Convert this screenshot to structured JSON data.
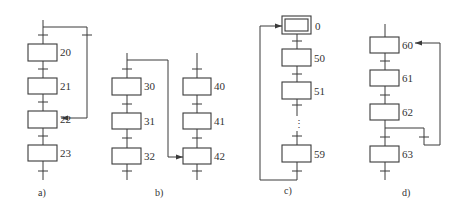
{
  "diagram": {
    "type": "SFC / GRAFCET sequence examples",
    "colors": {
      "line": "#3a3a3a",
      "text": "#333333",
      "background": "#ffffff"
    },
    "panels": [
      {
        "caption": "a)",
        "description": "Step skip (jump forward)",
        "steps": [
          "20",
          "21",
          "22",
          "23"
        ],
        "jump": {
          "from": "before 20",
          "to": "22"
        }
      },
      {
        "caption": "b)",
        "description": "Jump between sequences",
        "sequences": [
          {
            "steps": [
              "30",
              "31",
              "32"
            ]
          },
          {
            "steps": [
              "40",
              "41",
              "42"
            ]
          }
        ],
        "jump": {
          "from": "before 30",
          "to": "42"
        }
      },
      {
        "caption": "c)",
        "description": "Cyclic sequence with initial step",
        "initial_step": "0",
        "steps": [
          "0",
          "50",
          "51",
          "59"
        ],
        "ellipsis": "⋮",
        "jump": {
          "from": "after 59",
          "to": "0"
        }
      },
      {
        "caption": "d)",
        "description": "Loop back (repeat sequence)",
        "steps": [
          "60",
          "61",
          "62",
          "63"
        ],
        "jump": {
          "from": "after 62",
          "to": "60"
        }
      }
    ]
  }
}
